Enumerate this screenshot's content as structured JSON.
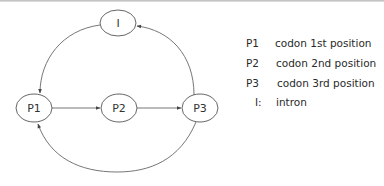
{
  "diagram": {
    "nodes": [
      {
        "id": "I",
        "label": "I",
        "cx": 118,
        "cy": 23,
        "rx": 18,
        "ry": 13
      },
      {
        "id": "P1",
        "label": "P1",
        "cx": 34,
        "cy": 108,
        "rx": 18,
        "ry": 14
      },
      {
        "id": "P2",
        "label": "P2",
        "cx": 119,
        "cy": 108,
        "rx": 18,
        "ry": 14
      },
      {
        "id": "P3",
        "label": "P3",
        "cx": 200,
        "cy": 108,
        "rx": 18,
        "ry": 14
      }
    ],
    "edges": [
      {
        "from": "P1",
        "to": "P2"
      },
      {
        "from": "P2",
        "to": "P3"
      },
      {
        "from": "P3",
        "to": "I"
      },
      {
        "from": "I",
        "to": "P1"
      },
      {
        "from": "P3",
        "to": "P1"
      }
    ],
    "colors": {
      "stroke": "#555555",
      "text": "#333333",
      "background": "#ffffff"
    }
  },
  "legend": {
    "items": [
      {
        "key": "P1",
        "desc": "codon 1st position"
      },
      {
        "key": "P2",
        "desc": "codon 2nd position"
      },
      {
        "key": "P3",
        "desc": "codon 3rd position"
      },
      {
        "key": "I:",
        "desc": "intron"
      }
    ]
  }
}
